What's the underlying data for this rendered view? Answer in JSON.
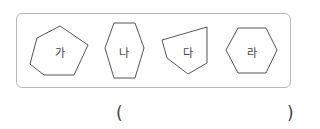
{
  "shapes": [
    {
      "label": "가",
      "points": "60,26 88,45 74,75 44,75 30,64 37,38",
      "label_x": 60,
      "label_y": 53
    },
    {
      "label": "나",
      "points": "114,23 135,23 144,48 135,78 114,78 105,48",
      "label_x": 124,
      "label_y": 53
    },
    {
      "label": "다",
      "points": "162,40 207,27 207,63 188,74 167,58",
      "label_x": 187,
      "label_y": 53
    },
    {
      "label": "라",
      "points": "238,28 266,28 277,50 266,73 238,73 226,50",
      "label_x": 252,
      "label_y": 53
    }
  ],
  "answer": {
    "open_paren": "(",
    "close_paren": ")",
    "value": ""
  },
  "colors": {
    "stroke": "#555555",
    "frame": "#b9b9b9"
  }
}
